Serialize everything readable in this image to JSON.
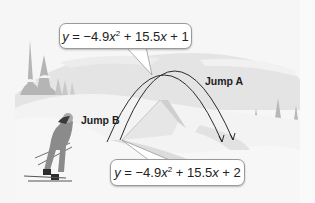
{
  "figure": {
    "type": "illustration",
    "scene": "snowy ski hill with two ski-jump trajectories",
    "colors": {
      "background": "#f6f6f6",
      "snow_shadow": "#d9d9d9",
      "trees": "#b9b9b9",
      "curve": "#2b2b2b",
      "callout_bg": "#ffffff",
      "callout_border": "#9a9a9a"
    }
  },
  "callouts": {
    "top": {
      "parts": {
        "y": "y",
        "eq": " = −4.9",
        "x1": "x",
        "exp": "2",
        "mid": " + 15.5",
        "x2": "x",
        "end": " + 1"
      },
      "text": "y = −4.9x² + 15.5x + 1"
    },
    "bottom": {
      "parts": {
        "y": "y",
        "eq": " = −4.9",
        "x1": "x",
        "exp": "2",
        "mid": " + 15.5",
        "x2": "x",
        "end": " + 2"
      },
      "text": "y = −4.9x² + 15.5x + 2"
    }
  },
  "labels": {
    "jump_a": "Jump A",
    "jump_b": "Jump B"
  },
  "icons": {
    "skier": "skier-illustration",
    "trees": "snowy-pine-trees",
    "ramp": "ski-jump-ramp"
  }
}
